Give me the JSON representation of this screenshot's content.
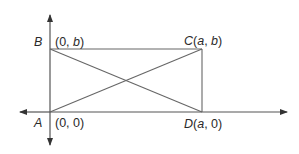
{
  "figure": {
    "type": "coordinate-geometry-rectangle",
    "colors": {
      "line": "#555555",
      "text": "#2a2a2a",
      "background": "#ffffff"
    },
    "points": {
      "A": {
        "name": "A",
        "coords": "(0, 0)"
      },
      "B": {
        "name": "B",
        "coords": "(0, b)"
      },
      "C": {
        "name": "C",
        "coords_label": "C(a, b)"
      },
      "D": {
        "name": "D",
        "coords_label": "D(a, 0)"
      }
    },
    "segments": [
      "AB",
      "BC",
      "CD",
      "DA",
      "AC",
      "BD"
    ],
    "axes": {
      "x": "double-arrow horizontal through A",
      "y": "double-arrow vertical through A"
    }
  }
}
